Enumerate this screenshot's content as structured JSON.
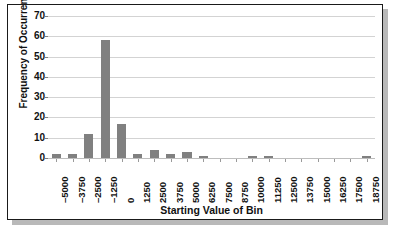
{
  "chart_data": {
    "type": "bar",
    "title": "",
    "xlabel": "Starting Value of Bin",
    "ylabel": "Frequency of Occurrence",
    "categories": [
      "-5000",
      "-3750",
      "-2500",
      "-1250",
      "0",
      "1250",
      "2500",
      "3750",
      "5000",
      "6250",
      "7500",
      "8750",
      "10000",
      "11250",
      "12500",
      "13750",
      "15000",
      "16250",
      "17500",
      "18750"
    ],
    "values": [
      2,
      2,
      12,
      58,
      17,
      2,
      4,
      2,
      3,
      1,
      0,
      0,
      1,
      1,
      0,
      0,
      0,
      0,
      0,
      1
    ],
    "ylim": [
      0,
      70
    ],
    "yticks": [
      "0",
      "10",
      "20",
      "30",
      "40",
      "50",
      "60",
      "70"
    ],
    "grid": true,
    "legend": "none",
    "bar_color": "#808080",
    "gridline_color": "#d3d3d3",
    "axis_color": "#7d7d7d",
    "frame_color": "#1a1a1a",
    "background_color": "#ffffff"
  }
}
